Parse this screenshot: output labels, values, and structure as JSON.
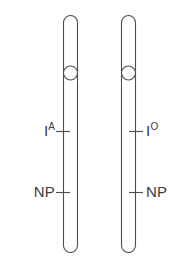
{
  "figure": {
    "type": "chromosome-pair-diagram",
    "background_color": "#ffffff",
    "outline_color": "#4d4d4d",
    "text_color": "#3b3b3b",
    "chromosomes": [
      {
        "id": "left",
        "name": "homolog-1",
        "x": 63,
        "width": 14,
        "top": 15,
        "bottom": 253,
        "centromere_y": 73,
        "centromere_diameter": 14,
        "label_side": "left",
        "loci": [
          {
            "name": "allele",
            "symbol": "I",
            "superscript": "A",
            "y": 131
          },
          {
            "name": "np",
            "symbol": "NP",
            "superscript": "",
            "y": 192
          }
        ]
      },
      {
        "id": "right",
        "name": "homolog-2",
        "x": 121,
        "width": 14,
        "top": 15,
        "bottom": 253,
        "centromere_y": 73,
        "centromere_diameter": 14,
        "label_side": "right",
        "loci": [
          {
            "name": "allele",
            "symbol": "I",
            "superscript": "O",
            "y": 131
          },
          {
            "name": "np",
            "symbol": "NP",
            "superscript": "",
            "y": 192
          }
        ]
      }
    ],
    "labels": {
      "left_allele_symbol": "I",
      "left_allele_superscript": "A",
      "left_np": "NP",
      "right_allele_symbol": "I",
      "right_allele_superscript": "O",
      "right_np": "NP"
    }
  }
}
